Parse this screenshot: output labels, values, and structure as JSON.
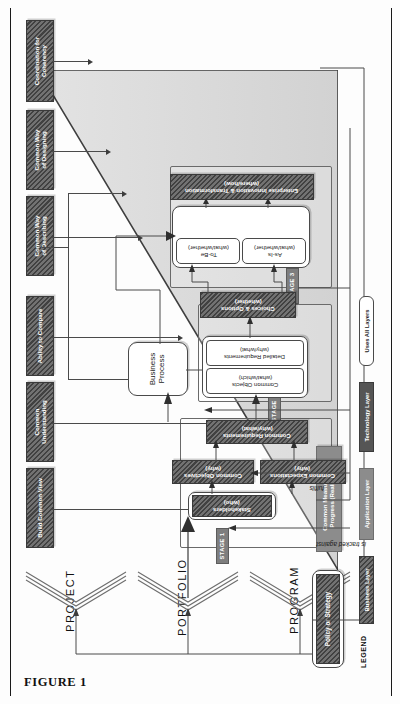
{
  "figure": {
    "caption": "FIGURE 1"
  },
  "axis": {
    "levels": [
      "PROJECT",
      "PORTFOLIO",
      "PROGRAM"
    ]
  },
  "drivers": [
    {
      "id": "build-common-view",
      "label": "Build Common View"
    },
    {
      "id": "common-understanding",
      "label": "Common\nUnderstanding"
    },
    {
      "id": "ability-to-compare",
      "label": "Ability to Compare"
    },
    {
      "id": "common-way-describing",
      "label": "Common Way\nof Describing"
    },
    {
      "id": "common-way-designing",
      "label": "Common Way\nof Designing"
    },
    {
      "id": "coordination-coherency",
      "label": "Coordination for\nCoherency"
    }
  ],
  "inputs": [
    {
      "id": "policy-or-strategy",
      "label": "Policy or Strategy"
    },
    {
      "id": "common-measures",
      "label": "Common Measures of\nProgress (Realised)"
    }
  ],
  "stages": [
    {
      "id": "stage-1",
      "label": "STAGE 1"
    },
    {
      "id": "stage-2",
      "label": "STAGE 2"
    },
    {
      "id": "stage-3",
      "label": "STAGE 3"
    }
  ],
  "nodes": [
    {
      "id": "stakeholders",
      "label": "Stakeholders\n(who)",
      "layer": "business"
    },
    {
      "id": "common-objectives",
      "label": "Common Objectives\n(why)",
      "layer": "business"
    },
    {
      "id": "common-expectations",
      "label": "Common Expectations\n(why)",
      "layer": "business"
    },
    {
      "id": "common-requirements",
      "label": "Common Requirements\n(why/what)",
      "layer": "business"
    },
    {
      "id": "business-process",
      "label": "Business\nProcess",
      "layer": "uses-all"
    },
    {
      "id": "common-objects",
      "label": "Common Objects\n(what/which)",
      "layer": "uses-all"
    },
    {
      "id": "detailed-requirements",
      "label": "Detailed Requirements\n(why/what)",
      "layer": "uses-all"
    },
    {
      "id": "choices-and-options",
      "label": "Choices & Options\n(whether)",
      "layer": "business"
    },
    {
      "id": "as-is",
      "label": "As-Is\n(what/whether)",
      "layer": "uses-all"
    },
    {
      "id": "to-be",
      "label": "To-Be\n(what/whether)",
      "layer": "uses-all"
    },
    {
      "id": "enterprise-innovation",
      "label": "Enterprise Innovation & Transformation\n(where/how)",
      "layer": "business"
    }
  ],
  "relations": [
    {
      "id": "fulfils",
      "label": "fulfils"
    },
    {
      "id": "is-tracked-against",
      "label": "is tracked against"
    }
  ],
  "legend": {
    "title": "LEGEND",
    "items": [
      {
        "id": "business-layer",
        "label": "Business Layer",
        "swatch": "hatch"
      },
      {
        "id": "application-layer",
        "label": "Application Layer",
        "swatch": "solidgray"
      },
      {
        "id": "technology-layer",
        "label": "Technology Layer",
        "swatch": "darkgray"
      },
      {
        "id": "uses-all-layers",
        "label": "Uses All Layers",
        "swatch": "white"
      }
    ]
  },
  "colors": {
    "business_layer": "#5d5d5d",
    "application_layer": "#8c8c8c",
    "technology_layer": "#555555",
    "uses_all_layers": "#ffffff",
    "wedge": "#d9d9d9",
    "line": "#4a4a4a"
  }
}
